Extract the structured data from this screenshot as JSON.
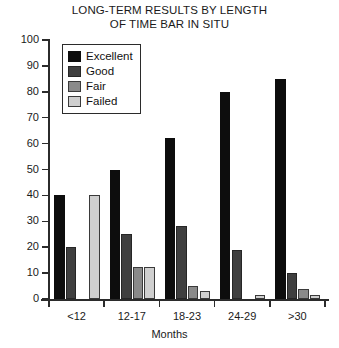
{
  "chart_data": {
    "type": "bar",
    "title": "LONG-TERM RESULTS BY LENGTH OF TIME BAR IN SITU",
    "title_lines": [
      "LONG-TERM RESULTS BY LENGTH",
      "OF TIME BAR IN SITU"
    ],
    "xlabel": "Months",
    "ylabel": "",
    "ylim": [
      0,
      100
    ],
    "yticks": [
      0,
      10,
      20,
      30,
      40,
      50,
      60,
      70,
      80,
      90,
      100
    ],
    "ytick_labels": [
      "0",
      "10",
      "20",
      "30",
      "40",
      "50",
      "60",
      "70",
      "80",
      "90",
      "100"
    ],
    "grid": false,
    "legend_position": "upper-left-inside",
    "categories": [
      "<12",
      "12-17",
      "18-23",
      "24-29",
      ">30"
    ],
    "series": [
      {
        "name": "Excellent",
        "color": "#0d0d0d",
        "values": [
          40,
          50,
          62,
          80,
          85
        ]
      },
      {
        "name": "Good",
        "color": "#3f3f3f",
        "values": [
          20,
          25,
          28,
          19,
          10
        ]
      },
      {
        "name": "Fair",
        "color": "#8a8a8a",
        "values": [
          0,
          12.5,
          5,
          0,
          4
        ]
      },
      {
        "name": "Failed",
        "color": "#cfcfcf",
        "values": [
          40,
          12.5,
          3,
          1.5,
          1.5
        ]
      }
    ]
  }
}
